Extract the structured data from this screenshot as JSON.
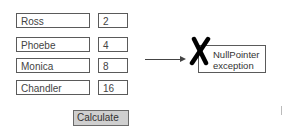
{
  "rows": [
    {
      "name": "Ross",
      "value": "2"
    },
    {
      "name": "Phoebe",
      "value": "4"
    },
    {
      "name": "Monica",
      "value": "8"
    },
    {
      "name": "Chandler",
      "value": "16"
    }
  ],
  "button": {
    "label": "Calculate"
  },
  "error": {
    "line1": "NullPointer",
    "line2": "exception",
    "icon": "x-mark-icon"
  },
  "colors": {
    "button_bg": "#cfcfcf",
    "border": "#5a5a5a",
    "x_mark": "#000000"
  }
}
